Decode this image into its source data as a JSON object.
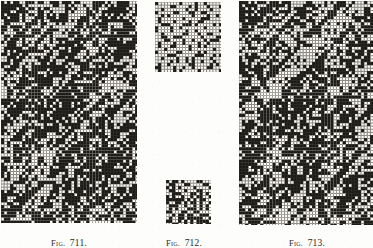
{
  "page": {
    "background_color": "#fdfdfb",
    "ink_color": "#1b1a17",
    "paper_tint": "#f2f1ec",
    "width": 373,
    "height": 248
  },
  "figures": [
    {
      "id": "fig-711",
      "caption_prefix": "Fig.",
      "caption_number": "711.",
      "caption_full": "FIG. 711.",
      "kind": "weave-point-paper-diagram",
      "x": 1,
      "y": 1,
      "width": 136,
      "height": 222,
      "cell": 3.05,
      "cols": 45,
      "rows": 73,
      "fill_ratio": 0.5,
      "pattern": "twill-diagonal-dense",
      "diagonal_period": 8,
      "diagonal_slope": 1,
      "noise": 0.34,
      "seed": 71101,
      "caption_x": 45,
      "caption_y": 232,
      "caption_width": 48
    },
    {
      "id": "fig-712-upper",
      "caption_prefix": "Fig.",
      "caption_number": "712.",
      "caption_full": "FIG. 712.",
      "kind": "weave-point-paper-diagram",
      "x": 155,
      "y": 2,
      "width": 66,
      "height": 70,
      "cell": 3.05,
      "cols": 22,
      "rows": 23,
      "fill_ratio": 0.14,
      "pattern": "sparse-sateen",
      "diagonal_period": 8,
      "diagonal_slope": 3,
      "noise": 0.06,
      "seed": 71201,
      "caption_x": 160,
      "caption_y": 232,
      "caption_width": 48
    },
    {
      "id": "fig-712-lower",
      "caption_prefix": "",
      "caption_number": "",
      "caption_full": "",
      "kind": "weave-point-paper-diagram",
      "x": 166,
      "y": 180,
      "width": 45,
      "height": 44,
      "cell": 3.05,
      "cols": 15,
      "rows": 15,
      "fill_ratio": 0.3,
      "pattern": "sparse-sateen",
      "diagonal_period": 5,
      "diagonal_slope": 2,
      "noise": 0.15,
      "seed": 71202,
      "caption_x": 0,
      "caption_y": 0,
      "caption_width": 0
    },
    {
      "id": "fig-713",
      "caption_prefix": "Fig.",
      "caption_number": "713.",
      "caption_full": "FIG. 713.",
      "kind": "weave-point-paper-diagram",
      "x": 239,
      "y": 1,
      "width": 134,
      "height": 224,
      "cell": 3.05,
      "cols": 44,
      "rows": 74,
      "fill_ratio": 0.48,
      "pattern": "twill-diagonal-banded",
      "diagonal_period": 11,
      "diagonal_slope": 1,
      "noise": 0.3,
      "seed": 71301,
      "caption_x": 283,
      "caption_y": 232,
      "caption_width": 48
    }
  ],
  "captions": [
    {
      "prefix": "Fig.",
      "number": "711.",
      "full": "FIG. 711."
    },
    {
      "prefix": "Fig.",
      "number": "712.",
      "full": "FIG. 712."
    },
    {
      "prefix": "Fig.",
      "number": "713.",
      "full": "FIG. 713."
    }
  ]
}
